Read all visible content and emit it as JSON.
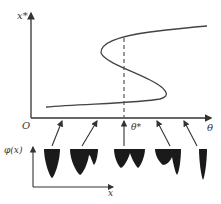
{
  "top_plot": {
    "y_axis_label": "x*",
    "x_axis_label": "θ",
    "origin_label": "O",
    "critical_label": "θ*",
    "curve": "S-shaped bifurcation curve with two folds",
    "dashed_line_at": "θ*"
  },
  "bottom_plot": {
    "y_axis_label": "φ(x)",
    "x_axis_label": "x",
    "potential_profiles": [
      {
        "id": 1,
        "wells": "single deep well"
      },
      {
        "id": 2,
        "wells": "deep well with shallow secondary well"
      },
      {
        "id": 3,
        "wells": "two equal wells"
      },
      {
        "id": 4,
        "wells": "shallow well with deep secondary well"
      },
      {
        "id": 5,
        "wells": "single deep well (right)"
      }
    ]
  },
  "colors": {
    "line": "#333333",
    "fill": "#1a1a1a"
  }
}
